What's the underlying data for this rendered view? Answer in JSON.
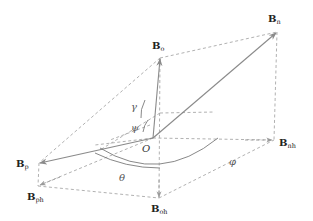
{
  "diagram": {
    "type": "3D vector decomposition",
    "origin": {
      "label": "O",
      "x": 153,
      "y": 138
    },
    "colors": {
      "vector": "#8a8a8a",
      "dashed": "#a8a8a8",
      "arc": "#7a7a7a",
      "text": "#222222"
    },
    "vectors": [
      {
        "id": "Bn",
        "base": "B",
        "sub": "n",
        "tip": [
          277,
          32
        ],
        "label_pos": [
          268,
          22
        ],
        "style": "solid"
      },
      {
        "id": "Bo",
        "base": "B",
        "sub": "o",
        "tip": [
          160,
          58
        ],
        "label_pos": [
          152,
          48
        ],
        "style": "solid"
      },
      {
        "id": "Bp",
        "base": "B",
        "sub": "p",
        "tip": [
          39,
          163
        ],
        "label_pos": [
          16,
          166
        ],
        "style": "solid"
      },
      {
        "id": "Bnh",
        "base": "B",
        "sub": "nh",
        "tip": [
          272,
          140
        ],
        "label_pos": [
          279,
          145
        ],
        "style": "dashed"
      },
      {
        "id": "Bph",
        "base": "B",
        "sub": "ph",
        "tip": [
          38,
          186
        ],
        "label_pos": [
          27,
          199
        ],
        "style": "dashed"
      },
      {
        "id": "Boh",
        "base": "B",
        "sub": "oh",
        "tip": [
          159,
          198
        ],
        "label_pos": [
          152,
          211
        ],
        "style": "dashed"
      }
    ],
    "angles": [
      {
        "symbol": "γ",
        "pos": [
          132,
          108
        ]
      },
      {
        "symbol": "ψ",
        "pos": [
          131,
          130
        ]
      },
      {
        "symbol": "φ",
        "pos": [
          231,
          165
        ]
      },
      {
        "symbol": "θ",
        "pos": [
          120,
          180
        ]
      }
    ],
    "origin_label": "O"
  }
}
